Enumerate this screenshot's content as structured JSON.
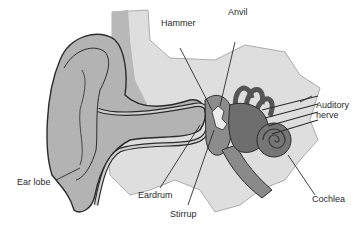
{
  "labels": {
    "hammer": "Hammer",
    "anvil": "Anvil",
    "auditory_nerve": "Auditory\nnerve",
    "ear_lobe": "Ear lobe",
    "eardrum": "Eardrum",
    "stirrup": "Stirrup",
    "cochlea": "Cochlea"
  },
  "colors": {
    "background": "#ffffff",
    "skin_light": "#d9d9d9",
    "skin_mid": "#b5b5b5",
    "canal_dark": "#8c8c8c",
    "inner_ear": "#6e6e6e",
    "outline": "#2b2b2b",
    "label_text": "#2a2a2a"
  }
}
